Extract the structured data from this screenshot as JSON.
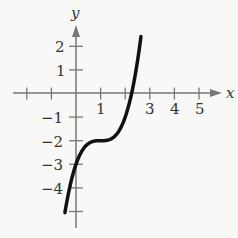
{
  "chart_data": {
    "type": "line",
    "title": "",
    "xlabel": "x",
    "ylabel": "y",
    "xlim": [
      -2,
      5.5
    ],
    "ylim": [
      -5.3,
      2.6
    ],
    "x_ticks": [
      -2,
      -1,
      1,
      2,
      3,
      4,
      5
    ],
    "x_tick_labels": [
      "",
      "",
      "1",
      "",
      "3",
      "4",
      "5"
    ],
    "y_ticks": [
      -5,
      -4,
      -3,
      -2,
      -1,
      1,
      2
    ],
    "y_tick_labels": [
      "",
      "-4",
      "-3",
      "-2",
      "-1",
      "1",
      "2"
    ],
    "grid": false,
    "series": [
      {
        "name": "f(x) = (x - 1)^3 - 2",
        "x": [
          -0.45,
          0,
          0.5,
          1,
          1.5,
          2,
          2.26,
          2.5,
          2.64
        ],
        "y": [
          -5.05,
          -3,
          -2.125,
          -2,
          -1.875,
          -1,
          0,
          1.375,
          2.41
        ]
      }
    ]
  },
  "labels": {
    "x_axis": "x",
    "y_axis": "y",
    "tick_x_1": "1",
    "tick_x_3": "3",
    "tick_x_4": "4",
    "tick_x_5": "5",
    "tick_y_2": "2",
    "tick_y_1": "1",
    "tick_y_m1": "−1",
    "tick_y_m2": "−2",
    "tick_y_m3": "−3",
    "tick_y_m4": "−4"
  }
}
